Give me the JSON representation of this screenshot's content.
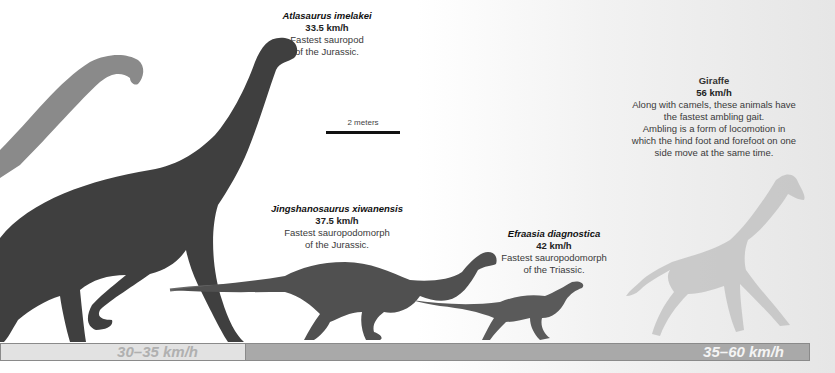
{
  "animals": [
    {
      "name": "Atlasaurus imelakei",
      "speed": "33.5 km/h",
      "desc_line1": "Fastest sauropod",
      "desc_line2": "of the Jurassic."
    },
    {
      "name": "Jingshanosaurus xiwanensis",
      "speed": "37.5 km/h",
      "desc_line1": "Fastest sauropodomorph",
      "desc_line2": "of the Jurassic."
    },
    {
      "name": "Efraasia diagnostica",
      "speed": "42 km/h",
      "desc_line1": "Fastest sauropodomorph",
      "desc_line2": "of the Triassic."
    },
    {
      "name": "Giraffe",
      "speed": "56 km/h",
      "desc_lines": [
        "Along with camels, these animals have",
        "the fastest ambling gait.",
        "Ambling is a form of locomotion in",
        "which the hind foot and forefoot on one",
        "side move at the same time."
      ]
    }
  ],
  "scale_bar": {
    "label": "2 meters"
  },
  "speed_ranges": [
    {
      "label": "30–35 km/h",
      "color": "#e2e2e2"
    },
    {
      "label": "35–60 km/h",
      "color": "#a9a9a9"
    }
  ],
  "icons": {
    "sauropod_background": "sauropod-silhouette",
    "atlasaurus": "atlasaurus-figure",
    "jingshanosaurus": "jingshanosaurus-figure",
    "efraasia": "efraasia-figure",
    "giraffe": "giraffe-silhouette"
  }
}
